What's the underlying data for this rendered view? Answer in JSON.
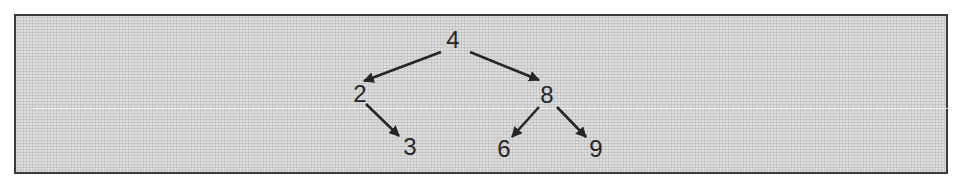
{
  "figure": {
    "type": "binary-tree-diagram",
    "frame": {
      "background_color": "#d6d6d6",
      "border_color": "#3b3b3b",
      "ink_color": "#262626"
    },
    "nodes": [
      {
        "id": "4",
        "label": "4",
        "x": 453,
        "y": 40
      },
      {
        "id": "2",
        "label": "2",
        "x": 360,
        "y": 94
      },
      {
        "id": "8",
        "label": "8",
        "x": 547,
        "y": 95
      },
      {
        "id": "3",
        "label": "3",
        "x": 410,
        "y": 147
      },
      {
        "id": "6",
        "label": "6",
        "x": 504,
        "y": 149
      },
      {
        "id": "9",
        "label": "9",
        "x": 596,
        "y": 149
      }
    ],
    "edges": [
      {
        "from": "4",
        "to": "2",
        "x1": 441,
        "y1": 52,
        "x2": 364,
        "y2": 81
      },
      {
        "from": "4",
        "to": "8",
        "x1": 470,
        "y1": 52,
        "x2": 539,
        "y2": 80
      },
      {
        "from": "2",
        "to": "3",
        "x1": 366,
        "y1": 104,
        "x2": 399,
        "y2": 136
      },
      {
        "from": "8",
        "to": "6",
        "x1": 539,
        "y1": 107,
        "x2": 512,
        "y2": 137
      },
      {
        "from": "8",
        "to": "9",
        "x1": 557,
        "y1": 107,
        "x2": 586,
        "y2": 137
      }
    ]
  }
}
